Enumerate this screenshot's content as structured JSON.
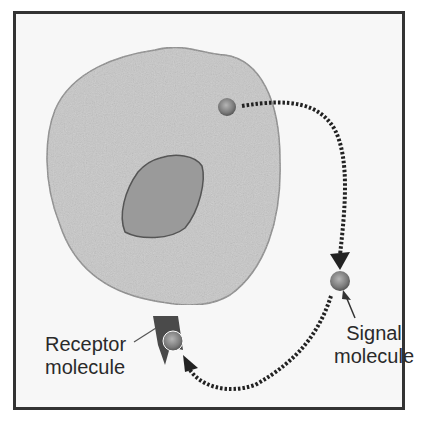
{
  "diagram": {
    "labels": {
      "receptor_line1": "Receptor",
      "receptor_line2": "molecule",
      "signal_line1": "Signal",
      "signal_line2": "molecule"
    },
    "nodes": [
      {
        "id": "cell",
        "type": "cell-body"
      },
      {
        "id": "nucleus",
        "type": "nucleus"
      },
      {
        "id": "signal-origin",
        "type": "signal-molecule",
        "position": "inside cell upper right"
      },
      {
        "id": "signal-free",
        "type": "signal-molecule",
        "position": "outside cell right"
      },
      {
        "id": "signal-bound",
        "type": "signal-molecule",
        "position": "bound to receptor"
      },
      {
        "id": "receptor",
        "type": "receptor-molecule",
        "position": "cell bottom membrane"
      }
    ],
    "edges": [
      {
        "from": "signal-origin",
        "to": "signal-free",
        "style": "dotted-arrow"
      },
      {
        "from": "signal-free",
        "to": "signal-bound",
        "style": "dotted-arrow"
      }
    ],
    "colors": {
      "frame_border": "#333333",
      "background": "#f7f7f7",
      "cell_fill": "#c8c8c8",
      "cell_stroke": "#8a8a8a",
      "nucleus_fill": "#9a9a9a",
      "nucleus_stroke": "#555555",
      "molecule_fill": "#8c8c8c",
      "receptor_fill": "#4a4a4a",
      "arrow": "#222222"
    }
  }
}
